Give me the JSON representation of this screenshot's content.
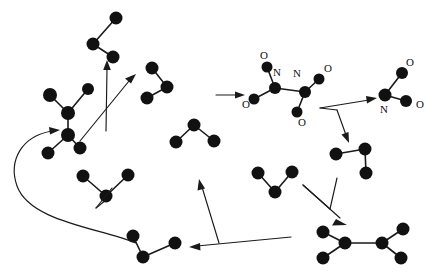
{
  "figure": {
    "background_color": "#ffffff",
    "atom_color": "#111111",
    "bond_color": "#1a1a1a",
    "arrow_color": "#1a1a1a",
    "width": 433,
    "height": 272
  },
  "molecules": [
    {
      "id": "mol-top-left-bent",
      "name": "bent-three-atom-fragment-top-left",
      "atoms": [
        {
          "label": "",
          "x": 116,
          "y": 18,
          "r": 6
        },
        {
          "label": "",
          "x": 93,
          "y": 44,
          "r": 6
        },
        {
          "label": "",
          "x": 113,
          "y": 57,
          "r": 6
        }
      ],
      "bonds": [
        [
          0,
          1
        ],
        [
          1,
          2
        ]
      ]
    },
    {
      "id": "mol-left-ethane",
      "name": "ethane-like-fragment-left",
      "atoms": [
        {
          "label": "",
          "x": 50,
          "y": 95,
          "r": 7
        },
        {
          "label": "",
          "x": 88,
          "y": 89,
          "r": 6
        },
        {
          "label": "",
          "x": 68,
          "y": 113,
          "r": 7
        },
        {
          "label": "",
          "x": 68,
          "y": 135,
          "r": 7
        },
        {
          "label": "",
          "x": 48,
          "y": 153,
          "r": 6
        },
        {
          "label": "",
          "x": 80,
          "y": 148,
          "r": 6
        }
      ],
      "bonds": [
        [
          0,
          2
        ],
        [
          1,
          2
        ],
        [
          2,
          3
        ],
        [
          3,
          4
        ],
        [
          3,
          5
        ]
      ]
    },
    {
      "id": "mol-mid-bent",
      "name": "bent-three-atom-fragment-mid-upper",
      "atoms": [
        {
          "label": "",
          "x": 152,
          "y": 68,
          "r": 6
        },
        {
          "label": "",
          "x": 167,
          "y": 87,
          "r": 6
        },
        {
          "label": "",
          "x": 147,
          "y": 98,
          "r": 6
        }
      ],
      "bonds": [
        [
          0,
          1
        ],
        [
          1,
          2
        ]
      ]
    },
    {
      "id": "mol-mid-v",
      "name": "v-shaped-three-atom-fragment-center",
      "atoms": [
        {
          "label": "",
          "x": 194,
          "y": 125,
          "r": 6
        },
        {
          "label": "",
          "x": 176,
          "y": 142,
          "r": 6
        },
        {
          "label": "",
          "x": 214,
          "y": 141,
          "r": 6
        }
      ],
      "bonds": [
        [
          0,
          1
        ],
        [
          0,
          2
        ]
      ]
    },
    {
      "id": "mol-dinitro",
      "name": "dinitro-compound-center-top",
      "atoms": [
        {
          "label": "O",
          "x": 267,
          "y": 67,
          "r": 5
        },
        {
          "label": "",
          "x": 275,
          "y": 88,
          "r": 6
        },
        {
          "label": "",
          "x": 305,
          "y": 92,
          "r": 6
        },
        {
          "label": "O",
          "x": 254,
          "y": 99,
          "r": 5
        },
        {
          "label": "O",
          "x": 319,
          "y": 79,
          "r": 5
        },
        {
          "label": "O",
          "x": 297,
          "y": 112,
          "r": 5
        }
      ],
      "bonds": [
        [
          0,
          1
        ],
        [
          1,
          2
        ],
        [
          1,
          3
        ],
        [
          2,
          4
        ],
        [
          2,
          5
        ]
      ],
      "labels": [
        {
          "text": "O",
          "x": 264,
          "y": 57
        },
        {
          "text": "N",
          "x": 276,
          "y": 73
        },
        {
          "text": "N",
          "x": 296,
          "y": 74
        },
        {
          "text": "O",
          "x": 247,
          "y": 104
        },
        {
          "text": "O",
          "x": 327,
          "y": 70
        },
        {
          "text": "O",
          "x": 302,
          "y": 122
        }
      ]
    },
    {
      "id": "mol-nitro-right",
      "name": "nitro-group-right",
      "atoms": [
        {
          "label": "",
          "x": 385,
          "y": 95,
          "r": 6
        },
        {
          "label": "",
          "x": 402,
          "y": 73,
          "r": 6
        },
        {
          "label": "",
          "x": 406,
          "y": 101,
          "r": 6
        }
      ],
      "bonds": [
        [
          0,
          1
        ],
        [
          0,
          2
        ]
      ],
      "labels": [
        {
          "text": "O",
          "x": 408,
          "y": 64
        },
        {
          "text": "N",
          "x": 384,
          "y": 110
        },
        {
          "text": "O",
          "x": 418,
          "y": 105
        }
      ]
    },
    {
      "id": "mol-right-bent",
      "name": "bent-three-atom-fragment-right-mid",
      "atoms": [
        {
          "label": "",
          "x": 336,
          "y": 154,
          "r": 6
        },
        {
          "label": "",
          "x": 365,
          "y": 149,
          "r": 6
        },
        {
          "label": "",
          "x": 366,
          "y": 173,
          "r": 6
        }
      ],
      "bonds": [
        [
          0,
          1
        ],
        [
          1,
          2
        ]
      ]
    },
    {
      "id": "mol-bottom-v",
      "name": "v-shaped-three-atom-fragment-bottom-left",
      "atoms": [
        {
          "label": "",
          "x": 106,
          "y": 196,
          "r": 6
        },
        {
          "label": "",
          "x": 83,
          "y": 176,
          "r": 6
        },
        {
          "label": "",
          "x": 128,
          "y": 175,
          "r": 6
        }
      ],
      "bonds": [
        [
          0,
          1
        ],
        [
          0,
          2
        ]
      ]
    },
    {
      "id": "mol-bottom-right-v",
      "name": "v-shaped-three-atom-fragment-bottom-mid",
      "atoms": [
        {
          "label": "",
          "x": 275,
          "y": 192,
          "r": 6
        },
        {
          "label": "",
          "x": 258,
          "y": 173,
          "r": 6
        },
        {
          "label": "",
          "x": 292,
          "y": 172,
          "r": 6
        }
      ],
      "bonds": [
        [
          0,
          1
        ],
        [
          0,
          2
        ]
      ]
    },
    {
      "id": "mol-bottom-chain",
      "name": "chain-fragment-bottom-left",
      "atoms": [
        {
          "label": "",
          "x": 133,
          "y": 236,
          "r": 6
        },
        {
          "label": "",
          "x": 143,
          "y": 257,
          "r": 6
        },
        {
          "label": "",
          "x": 175,
          "y": 243,
          "r": 6
        }
      ],
      "bonds": [
        [
          0,
          1
        ],
        [
          1,
          2
        ]
      ]
    },
    {
      "id": "mol-bottom-right-ethane",
      "name": "ethane-like-fragment-bottom-right",
      "atoms": [
        {
          "label": "",
          "x": 345,
          "y": 243,
          "r": 6
        },
        {
          "label": "",
          "x": 323,
          "y": 232,
          "r": 6
        },
        {
          "label": "",
          "x": 323,
          "y": 258,
          "r": 6
        },
        {
          "label": "",
          "x": 382,
          "y": 243,
          "r": 6
        },
        {
          "label": "",
          "x": 403,
          "y": 229,
          "r": 6
        },
        {
          "label": "",
          "x": 401,
          "y": 258,
          "r": 6
        }
      ],
      "bonds": [
        [
          0,
          1
        ],
        [
          0,
          2
        ],
        [
          0,
          3
        ],
        [
          3,
          4
        ],
        [
          3,
          5
        ]
      ]
    }
  ],
  "arrows": [
    {
      "id": "arrow-up-left",
      "name": "reaction-arrow-upward-left",
      "direction": "up",
      "from": {
        "x": 106,
        "y": 130
      },
      "to": {
        "x": 107,
        "y": 63
      }
    },
    {
      "id": "arrow-diagonal-upright",
      "name": "reaction-arrow-diagonal-up-right",
      "direction": "up-right",
      "from": {
        "x": 80,
        "y": 140
      },
      "to": {
        "x": 134,
        "y": 76
      }
    },
    {
      "id": "arrow-horizontal-to-dinitro",
      "name": "reaction-arrow-rightward-to-dinitro",
      "direction": "right",
      "from": {
        "x": 216,
        "y": 95
      },
      "to": {
        "x": 243,
        "y": 95
      }
    },
    {
      "id": "arrow-to-nitro-right",
      "name": "reaction-arrow-up-right-to-nitro",
      "direction": "up-right",
      "from": {
        "x": 320,
        "y": 107
      },
      "to": {
        "x": 376,
        "y": 98
      }
    },
    {
      "id": "arrow-down-to-right-bent",
      "name": "reaction-arrow-downward-to-right-fragment",
      "direction": "down",
      "from": {
        "x": 340,
        "y": 110
      },
      "to": {
        "x": 347,
        "y": 140
      }
    },
    {
      "id": "arrow-down-right-to-ethane",
      "name": "reaction-arrow-down-right-to-ethane",
      "direction": "down-right",
      "from": {
        "x": 310,
        "y": 185
      },
      "to": {
        "x": 345,
        "y": 222
      }
    },
    {
      "id": "arrow-left-long",
      "name": "reaction-arrow-leftward-long",
      "direction": "left",
      "from": {
        "x": 290,
        "y": 238
      },
      "to": {
        "x": 191,
        "y": 247
      }
    },
    {
      "id": "arrow-up-from-baseline",
      "name": "reaction-arrow-upward-from-baseline",
      "direction": "up",
      "from": {
        "x": 218,
        "y": 243
      },
      "to": {
        "x": 199,
        "y": 180
      }
    },
    {
      "id": "arrow-curved-feedback",
      "name": "reaction-arrow-curved-recycle",
      "direction": "curved-left-up",
      "from": {
        "x": 135,
        "y": 243
      },
      "to": {
        "x": 57,
        "y": 131
      }
    }
  ],
  "labels_all": [
    "O",
    "N",
    "N",
    "O",
    "O",
    "O",
    "O",
    "N",
    "O"
  ]
}
